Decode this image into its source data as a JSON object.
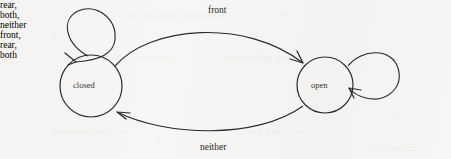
{
  "figure": {
    "kind": "finite-state-machine-diagram",
    "background_color": "#f7f6f4",
    "ink_color": "#2b2b2b",
    "width": 451,
    "height": 159
  },
  "states": [
    {
      "id": "closed",
      "label": "closed",
      "cx": 91,
      "cy": 86,
      "r": 31
    },
    {
      "id": "open",
      "label": "open",
      "cx": 325,
      "cy": 85,
      "r": 28
    }
  ],
  "transitions": [
    {
      "id": "closed-to-open",
      "label": "front",
      "from": "closed",
      "to": "open",
      "label_x": 208,
      "label_y": 6,
      "shape": "arc-above"
    },
    {
      "id": "open-to-closed",
      "label": "neither",
      "from": "open",
      "to": "closed",
      "label_x": 200,
      "label_y": 143,
      "shape": "arc-below"
    },
    {
      "id": "closed-self-loop",
      "label": "rear,\nboth,\nneither",
      "label_lines": [
        "rear,",
        "both,",
        "neither"
      ],
      "from": "closed",
      "to": "closed",
      "label_x": 4,
      "label_y": 14,
      "shape": "self-loop-upper-left"
    },
    {
      "id": "open-self-loop",
      "label": "front,\nrear,\nboth",
      "label_lines": [
        "front,",
        "rear,",
        "both"
      ],
      "from": "open",
      "to": "open",
      "label_x": 412,
      "label_y": 38,
      "shape": "self-loop-right"
    }
  ],
  "ghost_text": [
    {
      "text": "of the available information",
      "x": 118,
      "y": 10
    },
    {
      "text": "a transition of a finite state",
      "x": 66,
      "y": 52
    },
    {
      "text": "the machine and the",
      "x": 226,
      "y": 52
    },
    {
      "text": "associated with the",
      "x": 52,
      "y": 126
    },
    {
      "text": "of a transition",
      "x": 248,
      "y": 126
    },
    {
      "text": "information",
      "x": 372,
      "y": 143
    }
  ]
}
